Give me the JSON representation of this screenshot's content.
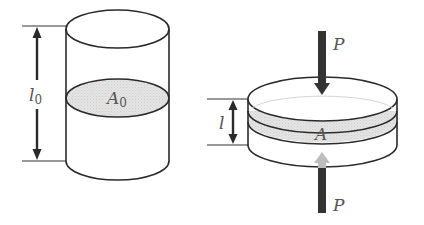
{
  "figure": {
    "left_cylinder": {
      "length_label": "l",
      "length_subscript": "0",
      "area_label": "A",
      "area_subscript": "0"
    },
    "right_disk": {
      "length_label": "l",
      "area_label": "A",
      "force_top_label": "P",
      "force_bottom_label": "P"
    },
    "colors": {
      "outline": "#2a2a2a",
      "cross_section_fill": "#e2e2e2",
      "arrow_dark": "#333333",
      "arrow_light": "#bdbdbd",
      "label_text": "#555555"
    }
  }
}
